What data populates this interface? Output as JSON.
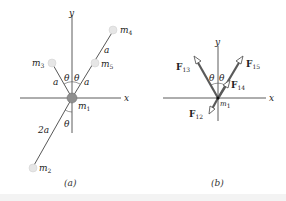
{
  "figure_a": {
    "caption": "(a)",
    "axes": {
      "x_label": "x",
      "y_label": "y"
    },
    "masses": [
      {
        "id": "m1",
        "label": "m",
        "sub": "1"
      },
      {
        "id": "m2",
        "label": "m",
        "sub": "2"
      },
      {
        "id": "m3",
        "label": "m",
        "sub": "3"
      },
      {
        "id": "m4",
        "label": "m",
        "sub": "4"
      },
      {
        "id": "m5",
        "label": "m",
        "sub": "5"
      }
    ],
    "distances": {
      "a_left": "a",
      "a_right": "a",
      "a_upper": "a",
      "two_a": "2a"
    },
    "angles": {
      "theta_left": "θ",
      "theta_right": "θ",
      "theta_lower": "θ"
    },
    "colors": {
      "mass_fill": "#e6e6e6",
      "m1_fill": "#8f8f8f",
      "rod": "#444444"
    }
  },
  "figure_b": {
    "caption": "(b)",
    "axes": {
      "x_label": "x",
      "y_label": "y"
    },
    "origin_mass": {
      "label": "m",
      "sub": "1"
    },
    "forces": [
      {
        "id": "F13",
        "label": "F",
        "sub": "13"
      },
      {
        "id": "F15",
        "label": "F",
        "sub": "15"
      },
      {
        "id": "F14",
        "label": "F",
        "sub": "14"
      },
      {
        "id": "F12",
        "label": "F",
        "sub": "12"
      }
    ],
    "angles": {
      "theta_left": "θ",
      "theta_right": "θ"
    },
    "colors": {
      "arrow": "#5a5a5a"
    }
  }
}
